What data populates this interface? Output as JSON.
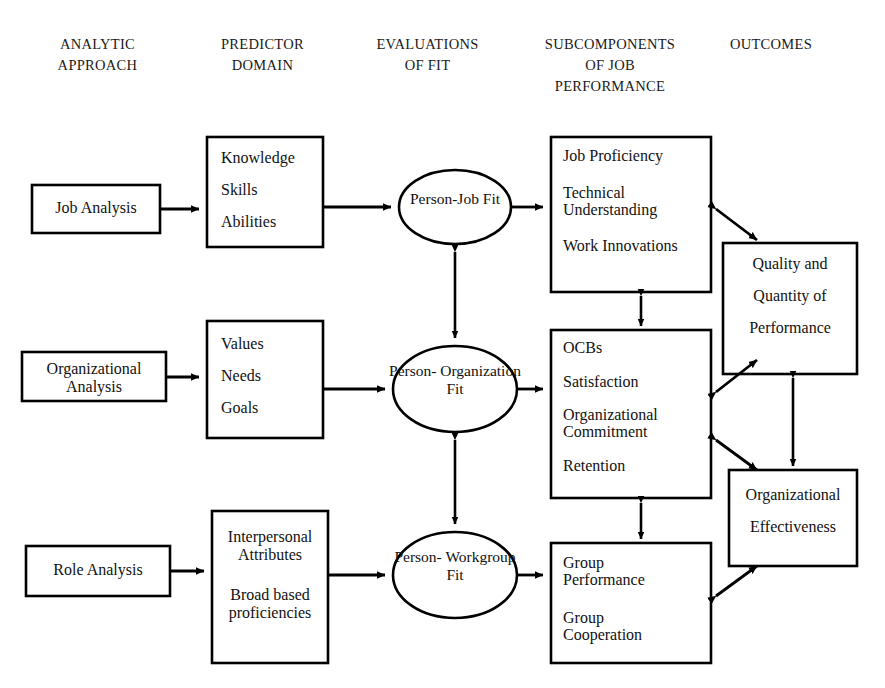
{
  "figure": {
    "type": "flow-diagram",
    "background_color": "#ffffff",
    "stroke_color": "#000000"
  },
  "column_headers": [
    {
      "id": "analytic-approach",
      "label": "ANALYTIC\nAPPROACH"
    },
    {
      "id": "predictor-domain",
      "label": "PREDICTOR\nDOMAIN"
    },
    {
      "id": "evaluations-of-fit",
      "label": "EVALUATIONS\nOF FIT"
    },
    {
      "id": "subcomponents-of-job-performance",
      "label": "SUBCOMPONENTS\nOF JOB\nPERFORMANCE"
    },
    {
      "id": "outcomes",
      "label": "OUTCOMES"
    }
  ],
  "analytic_approach": [
    {
      "id": "job-analysis",
      "lines": [
        "Job Analysis"
      ]
    },
    {
      "id": "organizational-analysis",
      "lines": [
        "Organizational",
        "Analysis"
      ]
    },
    {
      "id": "role-analysis",
      "lines": [
        "Role Analysis"
      ]
    }
  ],
  "predictor_domain": [
    {
      "id": "ksa",
      "lines": [
        "Knowledge",
        "Skills",
        "Abilities"
      ]
    },
    {
      "id": "vng",
      "lines": [
        "Values",
        "Needs",
        "Goals"
      ]
    },
    {
      "id": "interpersonal",
      "lines": [
        "Interpersonal",
        "Attributes",
        "Broad based",
        "proficiencies"
      ]
    }
  ],
  "evaluations_of_fit": [
    {
      "id": "person-job-fit",
      "lines": [
        "Person-Job",
        "Fit"
      ]
    },
    {
      "id": "person-organization-fit",
      "lines": [
        "Person-",
        "Organization",
        "Fit"
      ]
    },
    {
      "id": "person-workgroup-fit",
      "lines": [
        "Person-",
        "Workgroup",
        "Fit"
      ]
    }
  ],
  "subcomponents": [
    {
      "id": "job-performance-sub",
      "lines": [
        "Job Proficiency",
        "Technical",
        "Understanding",
        "Work Innovations"
      ]
    },
    {
      "id": "attitudes-sub",
      "lines": [
        "OCBs",
        "Satisfaction",
        "Organizational",
        "Commitment",
        "Retention"
      ]
    },
    {
      "id": "group-sub",
      "lines": [
        "Group",
        "Performance",
        "Group",
        "Cooperation"
      ]
    }
  ],
  "outcomes": [
    {
      "id": "quality-quantity",
      "lines": [
        "Quality and",
        "Quantity of",
        "Performance"
      ]
    },
    {
      "id": "organizational-effectiveness",
      "lines": [
        "Organizational",
        "Effectiveness"
      ]
    }
  ],
  "connections": [
    {
      "from": "job-analysis",
      "to": "ksa",
      "style": "single-arrow"
    },
    {
      "from": "organizational-analysis",
      "to": "vng",
      "style": "single-arrow"
    },
    {
      "from": "role-analysis",
      "to": "interpersonal",
      "style": "single-arrow"
    },
    {
      "from": "ksa",
      "to": "person-job-fit",
      "style": "single-arrow"
    },
    {
      "from": "vng",
      "to": "person-organization-fit",
      "style": "single-arrow"
    },
    {
      "from": "interpersonal",
      "to": "person-workgroup-fit",
      "style": "single-arrow"
    },
    {
      "from": "person-job-fit",
      "to": "job-performance-sub",
      "style": "single-arrow"
    },
    {
      "from": "person-organization-fit",
      "to": "attitudes-sub",
      "style": "single-arrow"
    },
    {
      "from": "person-workgroup-fit",
      "to": "group-sub",
      "style": "single-arrow"
    },
    {
      "from": "person-job-fit",
      "to": "person-organization-fit",
      "style": "double-arrow"
    },
    {
      "from": "person-organization-fit",
      "to": "person-workgroup-fit",
      "style": "double-arrow"
    },
    {
      "from": "job-performance-sub",
      "to": "attitudes-sub",
      "style": "double-arrow"
    },
    {
      "from": "attitudes-sub",
      "to": "group-sub",
      "style": "double-arrow"
    },
    {
      "from": "job-performance-sub",
      "to": "quality-quantity",
      "style": "double-arrow"
    },
    {
      "from": "attitudes-sub",
      "to": "quality-quantity",
      "style": "double-arrow"
    },
    {
      "from": "attitudes-sub",
      "to": "organizational-effectiveness",
      "style": "double-arrow"
    },
    {
      "from": "group-sub",
      "to": "organizational-effectiveness",
      "style": "double-arrow"
    },
    {
      "from": "quality-quantity",
      "to": "organizational-effectiveness",
      "style": "double-arrow"
    }
  ]
}
